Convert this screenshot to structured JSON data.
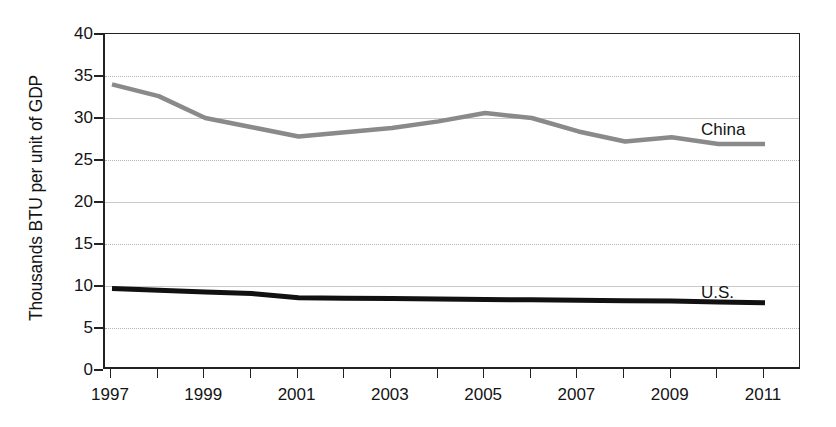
{
  "chart_data": {
    "type": "line",
    "title": "",
    "xlabel": "",
    "ylabel": "Thousands BTU per unit of GDP",
    "xlim": [
      1997,
      2011
    ],
    "ylim": [
      0,
      40
    ],
    "grid": true,
    "legend_position": "inline-right",
    "x": [
      1997,
      1998,
      1999,
      2000,
      2001,
      2002,
      2003,
      2004,
      2005,
      2006,
      2007,
      2008,
      2009,
      2010,
      2011
    ],
    "xtick_labels": [
      "1997",
      "",
      "1999",
      "",
      "2001",
      "",
      "2003",
      "",
      "2005",
      "",
      "2007",
      "",
      "2009",
      "",
      "2011"
    ],
    "ytick_labels": [
      "0",
      "5",
      "10",
      "15",
      "20",
      "25",
      "30",
      "35",
      "40"
    ],
    "ytick_values": [
      0,
      5,
      10,
      15,
      20,
      25,
      30,
      35,
      40
    ],
    "series": [
      {
        "name": "China",
        "color": "#8a8a8a",
        "width": 4.5,
        "label": "China",
        "values": [
          34.0,
          32.6,
          30.0,
          28.9,
          27.8,
          28.3,
          28.8,
          29.6,
          30.6,
          30.0,
          28.4,
          27.2,
          27.7,
          26.9,
          26.9
        ]
      },
      {
        "name": "U.S.",
        "color": "#111111",
        "width": 5.0,
        "label": "U.S.",
        "values": [
          9.7,
          9.5,
          9.3,
          9.1,
          8.6,
          8.55,
          8.5,
          8.45,
          8.4,
          8.35,
          8.3,
          8.25,
          8.2,
          8.1,
          8.0
        ]
      }
    ]
  }
}
